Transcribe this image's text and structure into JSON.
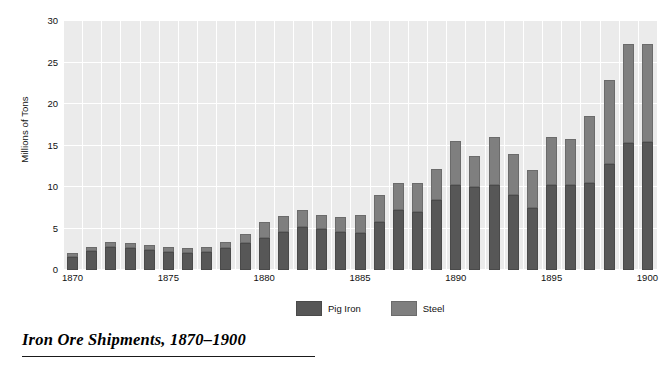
{
  "caption": "Iron Ore Shipments, 1870–1900",
  "axis": {
    "ylabel": "Millions of Tons",
    "yticks": [
      0,
      5,
      10,
      15,
      20,
      25,
      30
    ],
    "xticks": [
      1870,
      1875,
      1880,
      1885,
      1890,
      1895,
      1900
    ]
  },
  "legend": {
    "position": "bottom-center",
    "entries": [
      {
        "label": "Pig Iron",
        "color": "#575757",
        "swatch": "pig-iron-swatch"
      },
      {
        "label": "Steel",
        "color": "#7f7f7f",
        "swatch": "steel-swatch"
      }
    ]
  },
  "colors": {
    "plot_background": "#ebebeb",
    "gridline": "#ffffff",
    "pig_iron": "#575757",
    "steel": "#7f7f7f",
    "text": "#111111",
    "page_background": "#ffffff"
  },
  "chart_data": {
    "type": "bar",
    "subtype": "stacked",
    "title": "Iron Ore Shipments, 1870–1900",
    "xlabel": "",
    "ylabel": "Millions of Tons",
    "ylim": [
      0,
      30
    ],
    "grid": "both",
    "legend_position": "bottom-center",
    "categories": [
      1870,
      1871,
      1872,
      1873,
      1874,
      1875,
      1876,
      1877,
      1878,
      1879,
      1880,
      1881,
      1882,
      1883,
      1884,
      1885,
      1886,
      1887,
      1888,
      1889,
      1890,
      1891,
      1892,
      1893,
      1894,
      1895,
      1896,
      1897,
      1898,
      1899,
      1900
    ],
    "series": [
      {
        "name": "Pig Iron",
        "color": "#575757",
        "values": [
          1.6,
          2.3,
          2.8,
          2.6,
          2.4,
          2.2,
          2.1,
          2.2,
          2.6,
          3.2,
          3.9,
          4.6,
          5.2,
          5.0,
          4.6,
          4.5,
          5.8,
          7.2,
          7.0,
          8.4,
          10.2,
          10.0,
          10.2,
          9.0,
          7.5,
          10.2,
          10.3,
          10.5,
          12.8,
          15.3,
          15.4
        ]
      },
      {
        "name": "Steel",
        "color": "#7f7f7f",
        "values": [
          0.5,
          0.5,
          0.6,
          0.7,
          0.6,
          0.6,
          0.6,
          0.6,
          0.8,
          1.1,
          1.9,
          1.9,
          2.0,
          1.6,
          1.8,
          2.1,
          3.2,
          3.3,
          3.5,
          3.8,
          5.3,
          3.7,
          5.8,
          5.0,
          4.5,
          5.8,
          5.5,
          8.0,
          10.1,
          11.9,
          11.8
        ]
      }
    ],
    "totals": [
      2.1,
      2.8,
      3.4,
      3.3,
      3.0,
      2.8,
      2.7,
      2.8,
      3.4,
      4.3,
      5.8,
      6.5,
      7.2,
      6.6,
      6.4,
      6.6,
      9.0,
      10.5,
      10.5,
      12.2,
      15.5,
      13.7,
      16.0,
      14.0,
      12.0,
      16.0,
      15.8,
      18.5,
      22.9,
      27.2,
      27.2
    ]
  }
}
